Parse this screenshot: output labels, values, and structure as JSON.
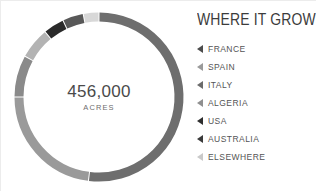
{
  "center": {
    "value": "456,000",
    "unit": "ACRES"
  },
  "legend": {
    "title": "WHERE IT GROWS"
  },
  "chart_data": {
    "type": "pie",
    "variant": "donut",
    "title": "WHERE IT GROWS",
    "center_value": "456,000",
    "center_unit": "ACRES",
    "total_acres": 456000,
    "units": "acres",
    "start_angle_deg": 0,
    "direction": "clockwise",
    "legend_position": "right",
    "grid": false,
    "categories": [
      "FRANCE",
      "SPAIN",
      "ITALY",
      "ALGERIA",
      "USA",
      "AUSTRALIA",
      "ELSEWHERE"
    ],
    "values": [
      52,
      23,
      8,
      6,
      4,
      4,
      3
    ],
    "value_unit": "percent",
    "colors": [
      "#6e6e6e",
      "#9a9a9a",
      "#8a8a8a",
      "#b3b3b3",
      "#2a2a2a",
      "#585858",
      "#d8d8d8"
    ],
    "slices": [
      {
        "label": "FRANCE",
        "value": 52,
        "color": "#6e6e6e",
        "marker_color": "#4c4c4c"
      },
      {
        "label": "SPAIN",
        "value": 23,
        "color": "#9a9a9a",
        "marker_color": "#9a9a9a"
      },
      {
        "label": "ITALY",
        "value": 8,
        "color": "#8a8a8a",
        "marker_color": "#6b6b6b"
      },
      {
        "label": "ALGERIA",
        "value": 6,
        "color": "#b3b3b3",
        "marker_color": "#8f8f8f"
      },
      {
        "label": "USA",
        "value": 4,
        "color": "#2a2a2a",
        "marker_color": "#2e2e2e"
      },
      {
        "label": "AUSTRALIA",
        "value": 4,
        "color": "#585858",
        "marker_color": "#3a3a3a"
      },
      {
        "label": "ELSEWHERE",
        "value": 3,
        "color": "#d8d8d8",
        "marker_color": "#c9c9c9"
      }
    ]
  }
}
